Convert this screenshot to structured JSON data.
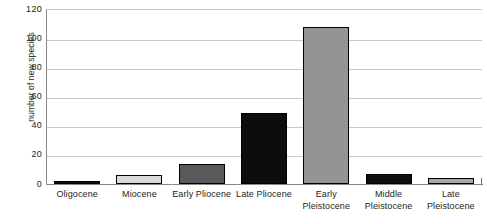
{
  "chart_data": {
    "type": "bar",
    "title": "",
    "subtitle": "",
    "xlabel": "",
    "ylabel": "number of new species",
    "ylim": [
      0,
      120
    ],
    "ytick_values": [
      0,
      20,
      40,
      60,
      80,
      100,
      120
    ],
    "ytick_labels": [
      "0",
      "20",
      "40",
      "60",
      "80",
      "100",
      "120"
    ],
    "grid": true,
    "legend": "none",
    "categories": [
      "Oligocene",
      "Miocene",
      "Early Pliocene",
      "Late Pliocene",
      "Early Pleistocene",
      "Middle Pleistocene",
      "Late Pleistocene"
    ],
    "category_lines": [
      [
        "Oligocene"
      ],
      [
        "Miocene"
      ],
      [
        "Early Pliocene"
      ],
      [
        "Late Pliocene"
      ],
      [
        "Early",
        "Pleistocene"
      ],
      [
        "Middle",
        "Pleistocene"
      ],
      [
        "Late",
        "Pleistocene"
      ]
    ],
    "values": [
      2,
      6,
      14,
      49,
      108,
      7,
      4
    ],
    "bar_colors": [
      "#0d0d0d",
      "#d9d9d9",
      "#595959",
      "#0d0d0d",
      "#949494",
      "#0d0d0d",
      "#a6a6a6"
    ],
    "bar_border_color": "#000000",
    "gridline_color": "#c9c9c9",
    "axis_color": "#8a8a8a",
    "text_color": "#231f20",
    "background": "#ffffff"
  }
}
